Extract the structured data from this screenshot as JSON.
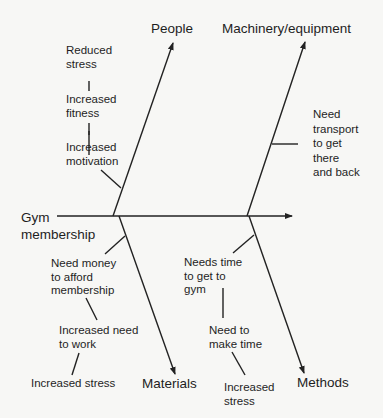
{
  "diagram": {
    "type": "fishbone",
    "effect": "Gym\nmembership",
    "categories": {
      "people": "People",
      "machinery": "Machinery/equipment",
      "materials": "Materials",
      "methods": "Methods"
    },
    "causes": {
      "people": [
        "Reduced\nstress",
        "Increased\nfitness",
        "Increased\nmotivation"
      ],
      "machinery": [
        "Need\ntransport\nto get\nthere\nand back"
      ],
      "materials": [
        "Need money\nto afford\nmembership",
        "Increased need\nto work",
        "Increased stress"
      ],
      "methods": [
        "Needs time\nto get to\ngym",
        "Need to\nmake time",
        "Increased\nstress"
      ]
    }
  }
}
